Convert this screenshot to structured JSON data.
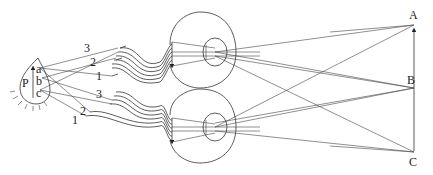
{
  "diagram": {
    "object_labels": {
      "top": "A",
      "middle": "B",
      "bottom": "C"
    },
    "brain_labels": {
      "region": "P",
      "top": "a",
      "middle": "b",
      "bottom": "c"
    },
    "upper_fiber_labels": [
      "3",
      "2",
      "1"
    ],
    "lower_fiber_labels": [
      "3",
      "2",
      "1"
    ],
    "colors": {
      "line": "#333333",
      "background": "#ffffff"
    }
  }
}
